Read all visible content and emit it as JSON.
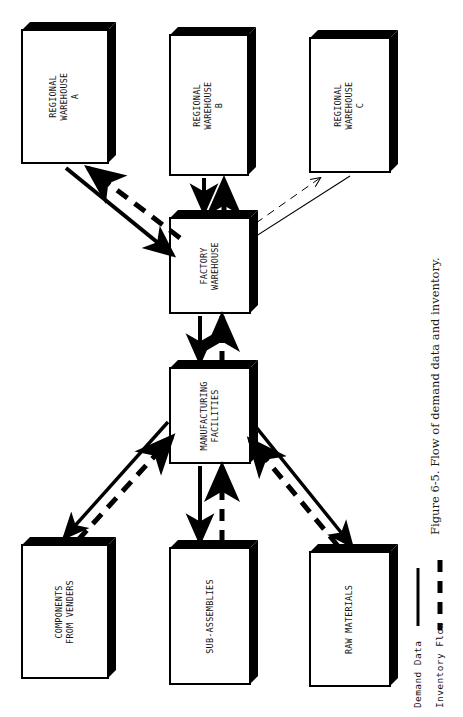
{
  "figure": {
    "caption": "Figure 6-5. Flow of demand data and inventory.",
    "orientation": "rotated-90"
  },
  "nodes": [
    {
      "id": "regional-warehouse-a",
      "line1": "REGIONAL",
      "line2": "WAREHOUSE",
      "line3": "A",
      "x": 22,
      "y": 30,
      "w": 86,
      "h": 133
    },
    {
      "id": "regional-warehouse-b",
      "line1": "REGIONAL",
      "line2": "WAREHOUSE",
      "line3": "B",
      "x": 170,
      "y": 35,
      "w": 78,
      "h": 140
    },
    {
      "id": "regional-warehouse-c",
      "line1": "REGIONAL",
      "line2": "WAREHOUSE",
      "line3": "C",
      "x": 310,
      "y": 38,
      "w": 80,
      "h": 134
    },
    {
      "id": "factory-warehouse",
      "line1": "FACTORY",
      "line2": "WAREHOUSE",
      "line3": "",
      "x": 170,
      "y": 218,
      "w": 80,
      "h": 95
    },
    {
      "id": "manufacturing-facilities",
      "line1": "MANUFACTURING",
      "line2": "FACILITIES",
      "line3": "",
      "x": 170,
      "y": 368,
      "w": 80,
      "h": 95
    },
    {
      "id": "components-from-venders",
      "line1": "COMPONENTS",
      "line2": "FROM  VENDERS",
      "line3": "",
      "x": 22,
      "y": 545,
      "w": 86,
      "h": 133
    },
    {
      "id": "sub-assemblies",
      "line1": "SUB-ASSEMBLIES",
      "line2": "",
      "line3": "",
      "x": 170,
      "y": 548,
      "w": 80,
      "h": 136
    },
    {
      "id": "raw-materials",
      "line1": "RAW MATERIALS",
      "line2": "",
      "line3": "",
      "x": 310,
      "y": 552,
      "w": 80,
      "h": 134
    }
  ],
  "legend": {
    "items": [
      {
        "id": "demand-data",
        "label": "Demand Data",
        "style": "solid"
      },
      {
        "id": "inventory-flow",
        "label": "Inventory Flow",
        "style": "dashed"
      }
    ]
  },
  "flows": [
    {
      "from": "factory-warehouse",
      "to": "regional-warehouse-a",
      "style": "dashed",
      "meaning": "Inventory Flow"
    },
    {
      "from": "regional-warehouse-a",
      "to": "factory-warehouse",
      "style": "solid",
      "meaning": "Demand Data"
    },
    {
      "from": "factory-warehouse",
      "to": "regional-warehouse-b",
      "style": "dashed",
      "meaning": "Inventory Flow"
    },
    {
      "from": "regional-warehouse-b",
      "to": "factory-warehouse",
      "style": "solid",
      "meaning": "Demand Data"
    },
    {
      "from": "factory-warehouse",
      "to": "regional-warehouse-c",
      "style": "thin",
      "meaning": "Inventory Flow"
    },
    {
      "from": "regional-warehouse-c",
      "to": "factory-warehouse",
      "style": "thin",
      "meaning": "Demand Data"
    },
    {
      "from": "manufacturing-facilities",
      "to": "factory-warehouse",
      "style": "dashed",
      "meaning": "Inventory Flow"
    },
    {
      "from": "factory-warehouse",
      "to": "manufacturing-facilities",
      "style": "solid",
      "meaning": "Demand Data"
    },
    {
      "from": "components-from-venders",
      "to": "manufacturing-facilities",
      "style": "dashed",
      "meaning": "Inventory Flow"
    },
    {
      "from": "manufacturing-facilities",
      "to": "components-from-venders",
      "style": "solid",
      "meaning": "Demand Data"
    },
    {
      "from": "sub-assemblies",
      "to": "manufacturing-facilities",
      "style": "dashed",
      "meaning": "Inventory Flow"
    },
    {
      "from": "manufacturing-facilities",
      "to": "sub-assemblies",
      "style": "solid",
      "meaning": "Demand Data"
    },
    {
      "from": "raw-materials",
      "to": "manufacturing-facilities",
      "style": "dashed",
      "meaning": "Inventory Flow"
    },
    {
      "from": "manufacturing-facilities",
      "to": "raw-materials",
      "style": "solid",
      "meaning": "Demand Data"
    }
  ],
  "colors": {
    "ink": "#000000",
    "paper": "#ffffff"
  }
}
